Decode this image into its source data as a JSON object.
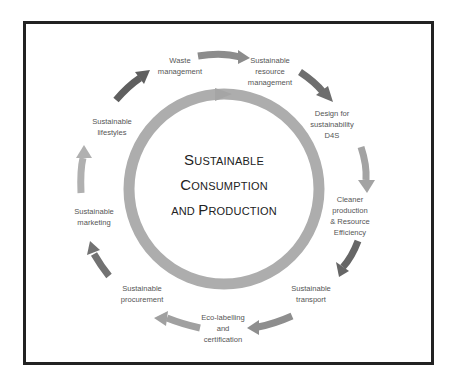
{
  "center": {
    "line1_big": "S",
    "line1_rest": "USTAINABLE",
    "line2_big": "C",
    "line2_rest": "ONSUMPTION",
    "line3_pre": "AND ",
    "line3_big": "P",
    "line3_rest": "RODUCTION"
  },
  "nodes": [
    {
      "label": "Waste\nmanagement"
    },
    {
      "label": "Sustainable\nresource\nmanagement"
    },
    {
      "label": "Design for\nsustainability\nD4S"
    },
    {
      "label": "Cleaner\nproduction\n& Resource\nEfficiency"
    },
    {
      "label": "Sustainable\ntransport"
    },
    {
      "label": "Eco-labelling\nand\ncertification"
    },
    {
      "label": "Sustainable\nprocurement"
    },
    {
      "label": "Sustainable\nmarketing"
    },
    {
      "label": "Sustainable\nlifestyles"
    }
  ],
  "colors": {
    "ring": "#a9a9a9",
    "arrow_dark": "#6b6b6b",
    "arrow_mid": "#8a8a8a",
    "arrow_light": "#b0b0b0",
    "frame": "#222222"
  }
}
